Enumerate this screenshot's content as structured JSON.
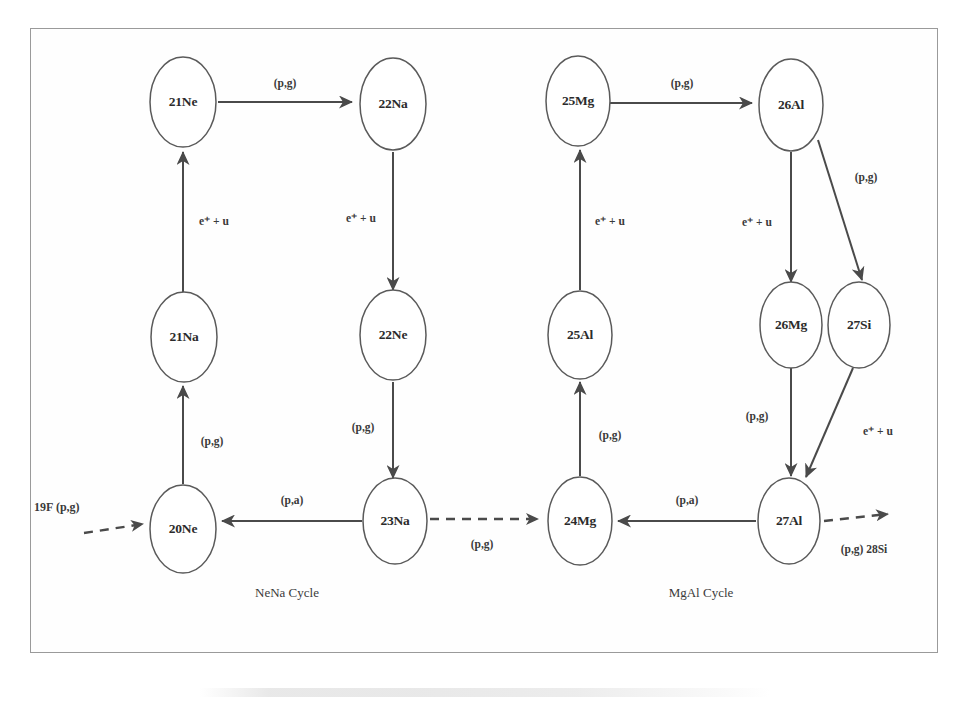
{
  "figure": {
    "frame_color": "#9a9a9a",
    "node_stroke_color": "#5a5a5a",
    "edge_color": "#4a4a4a",
    "background": "#ffffff"
  },
  "nena_cycle": {
    "caption": "NeNa Cycle",
    "nodes": {
      "ne21": "21Ne",
      "na22": "22Na",
      "ne22": "22Ne",
      "na23": "23Na",
      "ne20": "20Ne",
      "na21": "21Na"
    },
    "edges": {
      "ne21_to_na22": "(p,g)",
      "na22_to_ne22": "e⁺ + u",
      "ne22_to_na23": "(p,g)",
      "na23_to_ne20": "(p,a)",
      "ne20_to_na21": "(p,g)",
      "na21_to_ne21": "e⁺ + u"
    },
    "entry": {
      "label": "19F (p,g)",
      "style": "dashed"
    }
  },
  "mgal_cycle": {
    "caption": "MgAl Cycle",
    "nodes": {
      "mg25": "25Mg",
      "al26": "26Al",
      "mg26": "26Mg",
      "si27": "27Si",
      "al27": "27Al",
      "mg24": "24Mg",
      "al25": "25Al"
    },
    "edges": {
      "mg25_to_al26": "(p,g)",
      "al26_to_mg26": "e⁺ + u",
      "al26_to_si27": "(p,g)",
      "mg26_to_al27": "(p,g)",
      "si27_to_al27": "e⁺ + u",
      "al27_to_mg24": "(p,a)",
      "mg24_to_al25": "(p,g)",
      "al25_to_mg25": "e⁺ + u"
    },
    "exit": {
      "label": "(p,g) 28Si",
      "style": "dashed"
    }
  },
  "bridge": {
    "from": "23Na",
    "to": "24Mg",
    "label": "(p,g)",
    "style": "dashed"
  }
}
